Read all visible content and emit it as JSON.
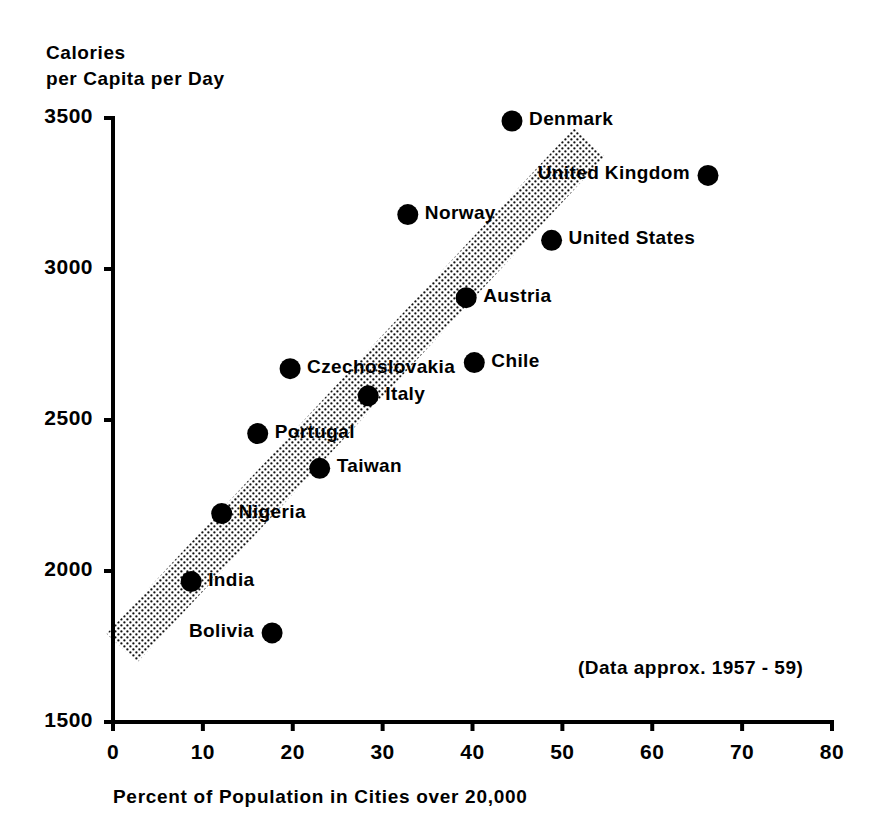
{
  "chart_data": {
    "type": "scatter",
    "title": "",
    "xlabel": "Percent of Population in Cities over 20,000",
    "ylabel_line1": "Calories",
    "ylabel_line2": "per Capita per Day",
    "xlim": [
      0,
      80
    ],
    "ylim": [
      1500,
      3500
    ],
    "xticks": [
      "0",
      "10",
      "20",
      "30",
      "40",
      "50",
      "60",
      "70",
      "80"
    ],
    "yticks": [
      "3500",
      "3000",
      "2500",
      "2000",
      "1500"
    ],
    "grid": false,
    "legend": "none",
    "annotation": "(Data approx. 1957 - 59)",
    "marker_color": "#000000",
    "band_color": "#000000",
    "band_description": "stippled diagonal trend band",
    "points": [
      {
        "label": "Denmark",
        "x": 44.4,
        "y": 3490,
        "label_side": "right"
      },
      {
        "label": "United Kingdom",
        "x": 66.2,
        "y": 3310,
        "label_side": "left"
      },
      {
        "label": "Norway",
        "x": 32.8,
        "y": 3180,
        "label_side": "right"
      },
      {
        "label": "United States",
        "x": 48.8,
        "y": 3095,
        "label_side": "right"
      },
      {
        "label": "Austria",
        "x": 39.3,
        "y": 2905,
        "label_side": "right"
      },
      {
        "label": "Chile",
        "x": 40.2,
        "y": 2690,
        "label_side": "right"
      },
      {
        "label": "Czechoslovakia",
        "x": 19.7,
        "y": 2670,
        "label_side": "right"
      },
      {
        "label": "Italy",
        "x": 28.4,
        "y": 2580,
        "label_side": "right"
      },
      {
        "label": "Portugal",
        "x": 16.1,
        "y": 2455,
        "label_side": "right"
      },
      {
        "label": "Taiwan",
        "x": 23.0,
        "y": 2340,
        "label_side": "right"
      },
      {
        "label": "Nigeria",
        "x": 12.1,
        "y": 2190,
        "label_side": "right"
      },
      {
        "label": "India",
        "x": 8.7,
        "y": 1965,
        "label_side": "right"
      },
      {
        "label": "Bolivia",
        "x": 17.7,
        "y": 1795,
        "label_side": "left"
      }
    ]
  },
  "axes": {
    "y_title_line1": "Calories",
    "y_title_line2": "per Capita per Day",
    "x_title": "Percent of Population in Cities over 20,000"
  },
  "annotation": {
    "text": "(Data approx. 1957 - 59)"
  }
}
